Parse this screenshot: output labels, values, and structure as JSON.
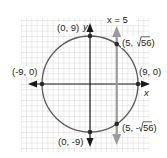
{
  "diagram": {
    "type": "circle-line-intersection",
    "circle": {
      "center": [
        0,
        0
      ],
      "radius": 9
    },
    "line": {
      "label": "x = 5",
      "x": 5
    },
    "axes": {
      "x_label": "x",
      "y_label": "y"
    },
    "points": [
      {
        "label": "(0, 9)",
        "x": 0,
        "y": 9
      },
      {
        "label": "(0, -9)",
        "x": 0,
        "y": -9
      },
      {
        "label": "(-9, 0)",
        "x": -9,
        "y": 0
      },
      {
        "label": "(9, 0)",
        "x": 9,
        "y": 0
      },
      {
        "label_prefix": "(5, ",
        "label_radicand": "56",
        "label_suffix": ")",
        "x": 5,
        "y": 7.483
      },
      {
        "label_prefix": "(5, -",
        "label_radicand": "56",
        "label_suffix": ")",
        "x": 5,
        "y": -7.483
      }
    ],
    "colors": {
      "circle": "#5a5a5a",
      "axes": "#1a1a1a",
      "line_x5": "#9a9a9a",
      "grid": "#c8c8c8",
      "point": "#2a2a2a"
    }
  }
}
